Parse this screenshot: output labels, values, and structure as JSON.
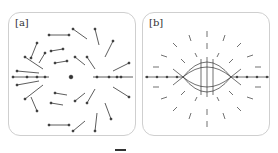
{
  "figure": {
    "panels": [
      {
        "id": "a",
        "label": "[a]",
        "description": "Vector field of arrows circulating around a central point, opening to the left"
      },
      {
        "id": "b",
        "label": "[b]",
        "description": "Quadrupole-like field with lens-shaped converging lines near center"
      }
    ],
    "colors": {
      "stroke": "#333333",
      "border": "#cfcfcf",
      "background": "#ffffff"
    }
  }
}
